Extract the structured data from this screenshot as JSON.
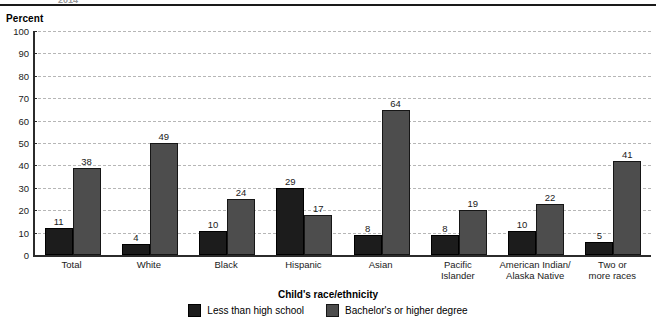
{
  "header": {
    "clipped_text": "2014"
  },
  "chart_data": {
    "type": "bar",
    "title": "",
    "xlabel": "Child's race/ethnicity",
    "ylabel": "Percent",
    "ylim": [
      0,
      100
    ],
    "ytick_step": 10,
    "yticks": [
      0,
      10,
      20,
      30,
      40,
      50,
      60,
      70,
      80,
      90,
      100
    ],
    "grid": true,
    "legend_position": "bottom",
    "categories": [
      "Total",
      "White",
      "Black",
      "Hispanic",
      "Asian",
      "Pacific\nIslander",
      "American Indian/\nAlaska Native",
      "Two or\nmore races"
    ],
    "series": [
      {
        "name": "Less than high school",
        "color": "#1c1c1c",
        "values": [
          11,
          4,
          10,
          29,
          8,
          8,
          10,
          5
        ]
      },
      {
        "name": "Bachelor's or higher degree",
        "color": "#4d4d4d",
        "values": [
          38,
          49,
          24,
          17,
          64,
          19,
          22,
          41
        ]
      }
    ]
  }
}
